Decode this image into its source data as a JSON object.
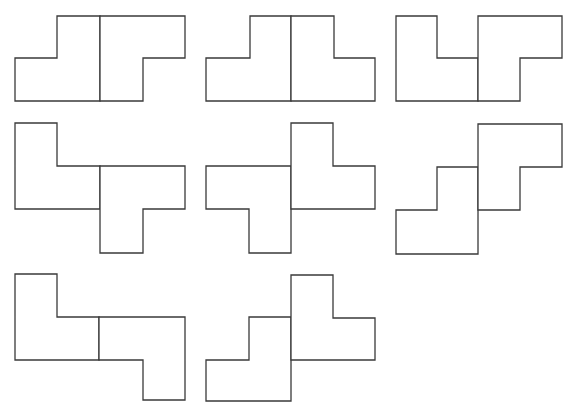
{
  "diagram": {
    "stroke_color": "#3a3a3a",
    "fill_color": "#ffffff",
    "background": "#ffffff",
    "figures": [
      {
        "id": 1,
        "pieces": [
          [
            [
              57,
              16
            ],
            [
              100,
              16
            ],
            [
              100,
              101
            ],
            [
              15,
              101
            ],
            [
              15,
              58
            ],
            [
              57,
              58
            ]
          ],
          [
            [
              100,
              16
            ],
            [
              185,
              16
            ],
            [
              185,
              58
            ],
            [
              143,
              58
            ],
            [
              143,
              101
            ],
            [
              100,
              101
            ]
          ]
        ]
      },
      {
        "id": 2,
        "pieces": [
          [
            [
              250,
              16
            ],
            [
              291,
              16
            ],
            [
              291,
              101
            ],
            [
              206,
              101
            ],
            [
              206,
              58
            ],
            [
              250,
              58
            ]
          ],
          [
            [
              291,
              16
            ],
            [
              334,
              16
            ],
            [
              334,
              58
            ],
            [
              375,
              58
            ],
            [
              375,
              101
            ],
            [
              291,
              101
            ]
          ]
        ]
      },
      {
        "id": 3,
        "pieces": [
          [
            [
              396,
              16
            ],
            [
              437,
              16
            ],
            [
              437,
              58
            ],
            [
              478,
              58
            ],
            [
              478,
              101
            ],
            [
              396,
              101
            ]
          ],
          [
            [
              478,
              16
            ],
            [
              562,
              16
            ],
            [
              562,
              58
            ],
            [
              520,
              58
            ],
            [
              520,
              101
            ],
            [
              478,
              101
            ]
          ]
        ]
      },
      {
        "id": 4,
        "pieces": [
          [
            [
              15,
              123
            ],
            [
              57,
              123
            ],
            [
              57,
              166
            ],
            [
              100,
              166
            ],
            [
              100,
              209
            ],
            [
              15,
              209
            ]
          ],
          [
            [
              100,
              166
            ],
            [
              185,
              166
            ],
            [
              185,
              209
            ],
            [
              143,
              209
            ],
            [
              143,
              253
            ],
            [
              100,
              253
            ]
          ]
        ]
      },
      {
        "id": 5,
        "pieces": [
          [
            [
              206,
              166
            ],
            [
              291,
              166
            ],
            [
              291,
              253
            ],
            [
              249,
              253
            ],
            [
              249,
              209
            ],
            [
              206,
              209
            ]
          ],
          [
            [
              291,
              123
            ],
            [
              333,
              123
            ],
            [
              333,
              166
            ],
            [
              375,
              166
            ],
            [
              375,
              209
            ],
            [
              291,
              209
            ]
          ]
        ]
      },
      {
        "id": 6,
        "pieces": [
          [
            [
              437,
              167
            ],
            [
              478,
              167
            ],
            [
              478,
              254
            ],
            [
              396,
              254
            ],
            [
              396,
              210
            ],
            [
              437,
              210
            ]
          ],
          [
            [
              478,
              124
            ],
            [
              562,
              124
            ],
            [
              562,
              167
            ],
            [
              520,
              167
            ],
            [
              520,
              210
            ],
            [
              478,
              210
            ]
          ]
        ]
      },
      {
        "id": 7,
        "pieces": [
          [
            [
              15,
              274
            ],
            [
              57,
              274
            ],
            [
              57,
              317
            ],
            [
              99,
              317
            ],
            [
              99,
              360
            ],
            [
              15,
              360
            ]
          ],
          [
            [
              99,
              317
            ],
            [
              185,
              317
            ],
            [
              185,
              400
            ],
            [
              143,
              400
            ],
            [
              143,
              360
            ],
            [
              99,
              360
            ]
          ]
        ]
      },
      {
        "id": 8,
        "pieces": [
          [
            [
              249,
              317
            ],
            [
              291,
              317
            ],
            [
              291,
              401
            ],
            [
              206,
              401
            ],
            [
              206,
              360
            ],
            [
              249,
              360
            ]
          ],
          [
            [
              291,
              275
            ],
            [
              333,
              275
            ],
            [
              333,
              318
            ],
            [
              375,
              318
            ],
            [
              375,
              360
            ],
            [
              291,
              360
            ]
          ]
        ]
      }
    ]
  }
}
